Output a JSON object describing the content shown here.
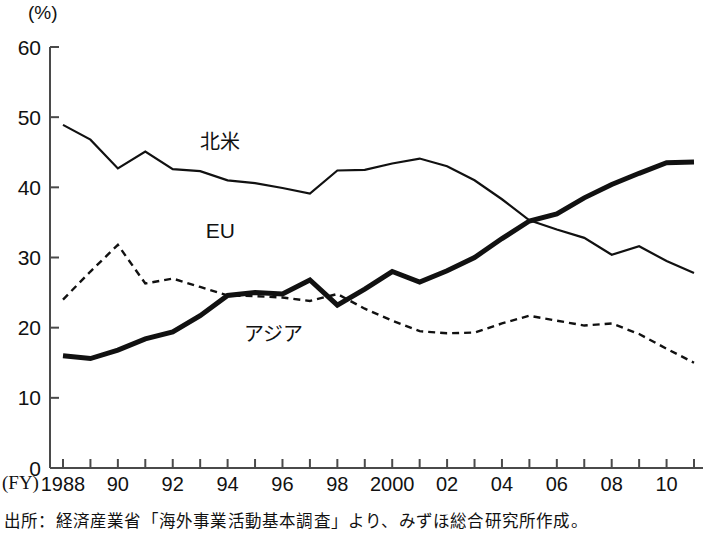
{
  "figure": {
    "unit_label": "(%)",
    "fy_label": "(FY)",
    "source_note": "出所：経済産業省「海外事業活動基本調査」より、みずほ総合研究所作成。"
  },
  "chart_data": {
    "type": "line",
    "title": "",
    "xlabel": "(FY)",
    "ylabel": "(%)",
    "ylim": [
      0,
      60
    ],
    "xlim": [
      1988,
      2011
    ],
    "yticks": [
      0,
      10,
      20,
      30,
      40,
      50,
      60
    ],
    "xticks": [
      1988,
      1989,
      1990,
      1991,
      1992,
      1993,
      1994,
      1995,
      1996,
      1997,
      1998,
      1999,
      2000,
      2001,
      2002,
      2003,
      2004,
      2005,
      2006,
      2007,
      2008,
      2009,
      2010,
      2011
    ],
    "xtick_labels": [
      "1988",
      "",
      "90",
      "",
      "92",
      "",
      "94",
      "",
      "96",
      "",
      "98",
      "",
      "2000",
      "",
      "02",
      "",
      "04",
      "",
      "06",
      "",
      "08",
      "",
      "10",
      ""
    ],
    "grid": false,
    "legend_position": "inline-annotations",
    "x": [
      1988,
      1989,
      1990,
      1991,
      1992,
      1993,
      1994,
      1995,
      1996,
      1997,
      1998,
      1999,
      2000,
      2001,
      2002,
      2003,
      2004,
      2005,
      2006,
      2007,
      2008,
      2009,
      2010,
      2011
    ],
    "series": [
      {
        "name": "北米",
        "style": "solid-thin",
        "color": "#111111",
        "label_x": 1993.0,
        "label_y": 45.5,
        "values": [
          48.9,
          46.8,
          42.7,
          45.1,
          42.6,
          42.3,
          41.0,
          40.6,
          39.9,
          39.1,
          42.4,
          42.5,
          43.4,
          44.1,
          43.0,
          41.0,
          38.3,
          35.3,
          34.0,
          32.8,
          30.4,
          31.6,
          29.5,
          27.8
        ]
      },
      {
        "name": "EU",
        "style": "dashed",
        "color": "#111111",
        "label_x": 1993.2,
        "label_y": 32.8,
        "values": [
          24.0,
          28.0,
          31.8,
          26.3,
          27.0,
          25.8,
          24.6,
          24.5,
          24.3,
          23.8,
          24.8,
          22.7,
          21.0,
          19.5,
          19.2,
          19.3,
          20.6,
          21.7,
          21.0,
          20.3,
          20.6,
          19.1,
          17.0,
          15.0
        ]
      },
      {
        "name": "アジア",
        "style": "solid-thick",
        "color": "#111111",
        "label_x": 1994.6,
        "label_y": 18.1,
        "values": [
          16.0,
          15.6,
          16.8,
          18.4,
          19.4,
          21.7,
          24.6,
          25.0,
          24.8,
          26.8,
          23.2,
          25.5,
          28.0,
          26.5,
          28.1,
          30.0,
          32.7,
          35.2,
          36.2,
          38.5,
          40.4,
          42.0,
          43.5,
          43.6
        ]
      }
    ]
  }
}
